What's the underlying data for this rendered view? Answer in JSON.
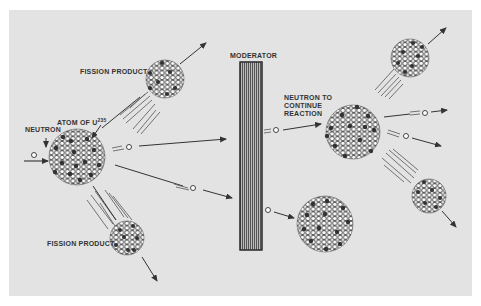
{
  "diagram": {
    "colors": {
      "background": "#e3e3e3",
      "ink": "#333333",
      "page": "#ffffff"
    },
    "labels": {
      "fission_product_top": "FISSION PRODUCT",
      "atom": "ATOM OF U",
      "atom_superscript": "235",
      "neutron": "NEUTRON",
      "moderator": "MODERATOR",
      "neutron_continue": "NEUTRON TO\nCONTINUE\nREACTION",
      "neutron_continue_l1": "NEUTRON  TO",
      "neutron_continue_l2": "CONTINUE",
      "neutron_continue_l3": "REACTION",
      "fission_product_bottom": "FISSION PRODUCT"
    },
    "nodes": [
      {
        "id": "u235-atom",
        "x": 77,
        "y": 157,
        "r": 28
      },
      {
        "id": "fission-product-top",
        "x": 165,
        "y": 79,
        "r": 19
      },
      {
        "id": "fission-product-bottom",
        "x": 127,
        "y": 238,
        "r": 17
      },
      {
        "id": "moderator",
        "x": 240,
        "y": 62,
        "w": 22,
        "h": 188
      },
      {
        "id": "right-atom-center",
        "x": 353,
        "y": 132,
        "r": 27
      },
      {
        "id": "right-fragment-top",
        "x": 410,
        "y": 58,
        "r": 19
      },
      {
        "id": "right-fragment-bottom",
        "x": 429,
        "y": 196,
        "r": 17
      },
      {
        "id": "right-atom-bottom",
        "x": 325,
        "y": 224,
        "r": 28
      }
    ]
  }
}
